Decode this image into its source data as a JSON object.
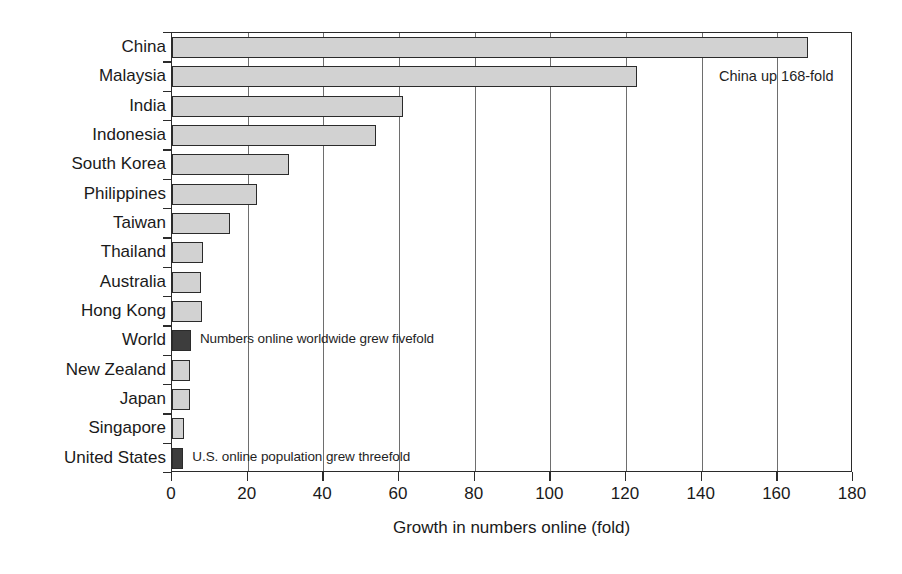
{
  "chart_data": {
    "type": "bar",
    "orientation": "horizontal",
    "title": "",
    "subtitle": "",
    "xlabel": "Growth in numbers online (fold)",
    "ylabel": "",
    "xlim": [
      0,
      180
    ],
    "xticks": [
      0,
      20,
      40,
      60,
      80,
      100,
      120,
      140,
      160,
      180
    ],
    "xtick_labels": [
      "0",
      "20",
      "40",
      "60",
      "80",
      "100",
      "120",
      "140",
      "160",
      "180"
    ],
    "grid": "vertical",
    "legend": "none",
    "categories": [
      "China",
      "Malaysia",
      "India",
      "Indonesia",
      "South Korea",
      "Philippines",
      "Taiwan",
      "Thailand",
      "Australia",
      "Hong Kong",
      "World",
      "New Zealand",
      "Japan",
      "Singapore",
      "United States"
    ],
    "values": [
      168,
      123,
      61,
      54,
      31,
      22.5,
      15.3,
      8.2,
      7.7,
      8.0,
      5.0,
      4.7,
      4.7,
      3.2,
      3.0
    ],
    "bar_styles": [
      "light",
      "light",
      "light",
      "light",
      "light",
      "light",
      "light",
      "light",
      "light",
      "light",
      "dark",
      "light",
      "light",
      "light",
      "dark"
    ],
    "colors": {
      "bar_light": "#d2d2d2",
      "bar_dark": "#3d3d3d",
      "bar_edge": "#2b2b2b",
      "gridline": "#6e6e6e",
      "axis": "#2b2b2b",
      "text": "#1a1a1a",
      "background": "#ffffff"
    },
    "annotations": [
      {
        "id": "china-callout",
        "text": "China up 168-fold",
        "category": "Malaysia",
        "placement": "outside-right"
      },
      {
        "id": "world-callout",
        "text": "Numbers online worldwide grew fivefold",
        "category": "World",
        "placement": "inside-right-of-bar"
      },
      {
        "id": "us-callout",
        "text": "U.S. online population grew threefold",
        "category": "United States",
        "placement": "inside-right-of-bar"
      }
    ]
  }
}
